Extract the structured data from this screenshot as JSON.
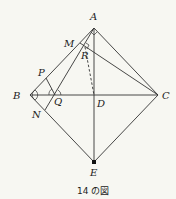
{
  "figure": {
    "caption": "14 の図",
    "points": {
      "A": {
        "label": "A",
        "x": 94,
        "y": 28
      },
      "B": {
        "label": "B",
        "x": 30,
        "y": 95
      },
      "C": {
        "label": "C",
        "x": 158,
        "y": 95
      },
      "D": {
        "label": "D",
        "x": 94,
        "y": 95
      },
      "E": {
        "label": "E",
        "x": 94,
        "y": 162
      },
      "M": {
        "label": "M",
        "x": 80,
        "y": 43
      },
      "R": {
        "label": "R",
        "x": 85,
        "y": 47
      },
      "P": {
        "label": "P",
        "x": 46,
        "y": 78
      },
      "Q": {
        "label": "Q",
        "x": 55,
        "y": 95
      },
      "N": {
        "label": "N",
        "x": 45,
        "y": 110
      }
    },
    "segments": [
      "AB",
      "AC",
      "BC",
      "AE",
      "BE",
      "CE",
      "MC",
      "AN",
      "PQ"
    ],
    "dashed_segments": [
      "RD"
    ],
    "markers": {
      "right_angles": [
        "A (BAC)",
        "R (ARM)"
      ],
      "equal_angles": [
        "B",
        "Q"
      ],
      "dot": "E"
    }
  }
}
